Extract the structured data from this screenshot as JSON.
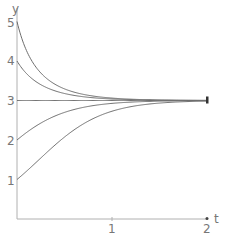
{
  "chart_data": {
    "type": "line",
    "title": "",
    "xlabel": "t",
    "ylabel": "y",
    "xlim": [
      0,
      2
    ],
    "ylim": [
      0,
      5
    ],
    "x_ticks": [
      "1",
      "2"
    ],
    "y_ticks": [
      "1",
      "2",
      "3",
      "4",
      "5"
    ],
    "grid": false,
    "legend": null,
    "model": "y' = y(3 - y), solutions converging to equilibrium y = 3",
    "series": [
      {
        "name": "y(0)=5",
        "x": [
          0,
          0.25,
          0.5,
          0.75,
          1.0,
          1.5,
          2.0
        ],
        "values": [
          5.0,
          3.8,
          3.29,
          3.11,
          3.04,
          3.0,
          3.0
        ]
      },
      {
        "name": "y(0)=4",
        "x": [
          0,
          0.25,
          0.5,
          0.75,
          1.0,
          1.5,
          2.0
        ],
        "values": [
          4.0,
          3.33,
          3.12,
          3.04,
          3.02,
          3.0,
          3.0
        ]
      },
      {
        "name": "y(0)=3",
        "x": [
          0,
          0.25,
          0.5,
          0.75,
          1.0,
          1.5,
          2.0
        ],
        "values": [
          3.0,
          3.0,
          3.0,
          3.0,
          3.0,
          3.0,
          3.0
        ]
      },
      {
        "name": "y(0)=2",
        "x": [
          0,
          0.25,
          0.5,
          0.75,
          1.0,
          1.5,
          2.0
        ],
        "values": [
          2.0,
          2.61,
          2.87,
          2.96,
          2.99,
          3.0,
          3.0
        ]
      },
      {
        "name": "y(0)=1",
        "x": [
          0,
          0.25,
          0.5,
          0.75,
          1.0,
          1.5,
          2.0
        ],
        "values": [
          1.0,
          1.75,
          2.07,
          2.71,
          2.91,
          2.99,
          3.0
        ]
      }
    ],
    "initial_values": [
      5,
      4,
      3,
      2,
      1
    ],
    "rate": 3,
    "equilibrium": 3
  },
  "axes": {
    "x_label": "t",
    "y_label": "y",
    "x_tick_1": "1",
    "x_tick_2": "2",
    "y_tick_1": "1",
    "y_tick_2": "2",
    "y_tick_3": "3",
    "y_tick_4": "4",
    "y_tick_5": "5"
  },
  "colors": {
    "axis": "#aaaaaa",
    "curve": "#6e6e6e",
    "text": "#777777"
  }
}
